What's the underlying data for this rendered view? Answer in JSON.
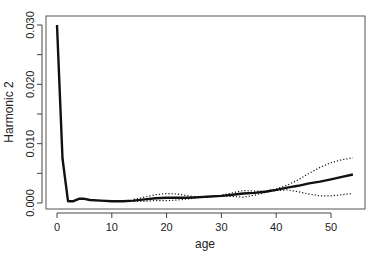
{
  "chart_data": {
    "type": "line",
    "title": "",
    "xlabel": "age",
    "ylabel": "Harmonic 2",
    "xlim": [
      -1,
      55.5
    ],
    "ylim": [
      -0.001,
      0.0315
    ],
    "grid": false,
    "legend": null,
    "x_ticks": [
      0,
      10,
      20,
      30,
      40,
      50
    ],
    "x_tick_labels": [
      "0",
      "10",
      "20",
      "30",
      "40",
      "50"
    ],
    "y_ticks": [
      0.0,
      0.005,
      0.01,
      0.015,
      0.02,
      0.025,
      0.03
    ],
    "y_tick_labels": [
      "0.000",
      "",
      "0.010",
      "",
      "0.020",
      "",
      "0.030"
    ],
    "series": [
      {
        "name": "estimate",
        "style": "solid-thick",
        "x": [
          0,
          1,
          2,
          3,
          4,
          5,
          6,
          8,
          10,
          12,
          14,
          16,
          18,
          20,
          22,
          24,
          26,
          28,
          30,
          32,
          34,
          36,
          38,
          40,
          42,
          44,
          46,
          48,
          50,
          52,
          54
        ],
        "values": [
          0.03,
          0.0075,
          0.0003,
          0.0003,
          0.0007,
          0.0007,
          0.0005,
          0.0004,
          0.0003,
          0.0003,
          0.0004,
          0.0006,
          0.0008,
          0.0009,
          0.0009,
          0.0009,
          0.001,
          0.0011,
          0.0012,
          0.0014,
          0.0016,
          0.0017,
          0.0019,
          0.0022,
          0.0026,
          0.0029,
          0.0033,
          0.0036,
          0.004,
          0.0044,
          0.0048
        ]
      },
      {
        "name": "upper-band",
        "style": "dotted",
        "x": [
          14,
          16,
          18,
          20,
          22,
          24,
          26,
          28,
          30,
          32,
          34,
          36,
          38,
          40,
          42,
          44,
          46,
          48,
          50,
          52,
          54
        ],
        "values": [
          0.0006,
          0.001,
          0.0014,
          0.0016,
          0.0015,
          0.0012,
          0.001,
          0.0011,
          0.0013,
          0.0017,
          0.0021,
          0.002,
          0.002,
          0.0024,
          0.003,
          0.0039,
          0.005,
          0.006,
          0.0068,
          0.0073,
          0.0076
        ]
      },
      {
        "name": "lower-band",
        "style": "dotted",
        "x": [
          14,
          16,
          18,
          20,
          22,
          24,
          26,
          28,
          30,
          32,
          34,
          36,
          38,
          40,
          42,
          44,
          46,
          48,
          50,
          52,
          54
        ],
        "values": [
          0.0003,
          0.0003,
          0.0004,
          0.0004,
          0.0005,
          0.0007,
          0.0009,
          0.0011,
          0.0011,
          0.0011,
          0.001,
          0.0013,
          0.0018,
          0.0021,
          0.0022,
          0.0019,
          0.0015,
          0.0012,
          0.0012,
          0.0014,
          0.0016
        ]
      }
    ]
  }
}
